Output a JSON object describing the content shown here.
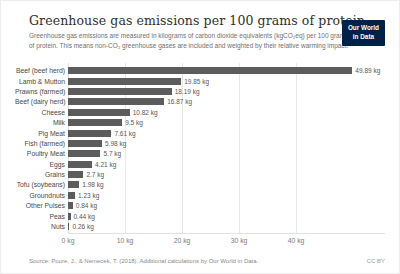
{
  "header": {
    "title": "Greenhouse gas emissions per 100 grams of protein",
    "subtitle": "Greenhouse gas emissions are measured in kilograms of carbon dioxide equivalents (kgCO₂eq) per 100 grams of protein. This means non-CO₂ greenhouse gases are included and weighted by their relative warming impact.",
    "logo": {
      "line1": "Our World",
      "line2": "in Data",
      "bg_color": "#002147",
      "text_color": "#ffffff"
    }
  },
  "chart_data": {
    "type": "bar",
    "orientation": "horizontal",
    "title": "Greenhouse gas emissions per 100 grams of protein",
    "unit": "kgCO₂eq per 100g protein",
    "bar_color": "#5c5c5c",
    "grid": true,
    "xlim": [
      0,
      56
    ],
    "tick_values": [
      0,
      10,
      20,
      30,
      40
    ],
    "tick_labels": [
      "0 kg",
      "10 kg",
      "20 kg",
      "30 kg",
      "40 kg"
    ],
    "categories": [
      "Beef (beef herd)",
      "Lamb & Mutton",
      "Prawns (farmed)",
      "Beef (dairy herd)",
      "Cheese",
      "Milk",
      "Pig Meat",
      "Fish (farmed)",
      "Poultry Meat",
      "Eggs",
      "Grains",
      "Tofu (soybeans)",
      "Groundnuts",
      "Other Pulses",
      "Peas",
      "Nuts"
    ],
    "values": [
      49.89,
      19.85,
      18.19,
      16.87,
      10.82,
      9.5,
      7.61,
      5.98,
      5.7,
      4.21,
      2.7,
      1.98,
      1.23,
      0.84,
      0.44,
      0.26
    ],
    "value_labels": [
      "49.89 kg",
      "19.85 kg",
      "18.19 kg",
      "16.87 kg",
      "10.82 kg",
      "9.5 kg",
      "7.61 kg",
      "5.98 kg",
      "5.7 kg",
      "4.21 kg",
      "2.7 kg",
      "1.98 kg",
      "1.23 kg",
      "0.84 kg",
      "0.44 kg",
      "0.26 kg"
    ]
  },
  "footer": {
    "source": "Source: Poore, J., & Nemecek, T. (2018). Additional calculations by Our World in Data.",
    "license": "CC BY"
  }
}
